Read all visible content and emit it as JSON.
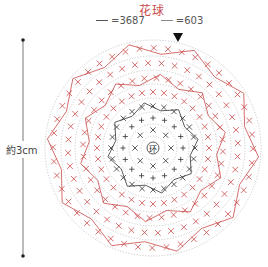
{
  "title": "花球",
  "legend": [
    {
      "label": "=3687",
      "color": "#555555"
    },
    {
      "label": "=603",
      "color": "#c94a4a"
    }
  ],
  "dimension": {
    "label": "約3cm"
  },
  "center_label": "环",
  "colors": {
    "yarn_a": "#333333",
    "yarn_b": "#c94a4a",
    "guide": "#aaaaaa"
  },
  "rounds": 7
}
